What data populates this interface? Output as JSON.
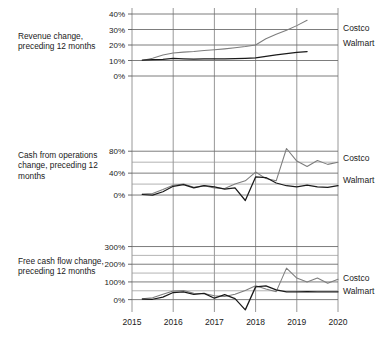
{
  "figure": {
    "width": 391,
    "height": 341,
    "background": "#ffffff",
    "line_color_costco": "#7d7d7d",
    "line_color_walmart": "#1a1a1a",
    "grid_color": "#8c8c8c"
  },
  "captions": {
    "revenue": "Revenue change, preceding 12 months",
    "cash_operations": "Cash from operations change, preceding 12 months",
    "free_cash_flow": "Free cash flow change, preceding 12 months"
  },
  "series_labels": {
    "costco": "Costco",
    "walmart": "Walmart"
  },
  "x_axis": {
    "ticks": [
      "2015",
      "2016",
      "2017",
      "2018",
      "2019",
      "2020"
    ],
    "min": 2015,
    "max": 2020
  },
  "chart_data": [
    {
      "type": "line",
      "title": "Revenue change, preceding 12 months",
      "xlabel": "",
      "ylabel": "Revenue change, preceding 12 months",
      "ylim": [
        0,
        40
      ],
      "ytick_labels": [
        "0%",
        "10%",
        "20%",
        "30%",
        "40%"
      ],
      "ytick_values": [
        0,
        10,
        20,
        30,
        40
      ],
      "yminor_values": [],
      "grid": true,
      "legend": "right-of-plot",
      "x": [
        2015.25,
        2015.5,
        2015.75,
        2016.0,
        2016.25,
        2016.5,
        2016.75,
        2017.0,
        2017.25,
        2017.5,
        2017.75,
        2018.0,
        2018.25,
        2018.5,
        2018.75,
        2019.0,
        2019.25
      ],
      "series": [
        {
          "name": "Costco",
          "values": [
            10.0,
            11.5,
            13.5,
            14.8,
            15.4,
            15.8,
            16.4,
            16.9,
            17.5,
            18.2,
            19.0,
            20.0,
            24.0,
            27.0,
            29.5,
            32.5,
            36.0
          ]
        },
        {
          "name": "Walmart",
          "values": [
            10.2,
            10.6,
            10.8,
            11.3,
            11.1,
            10.9,
            11.0,
            11.0,
            11.1,
            11.2,
            11.4,
            11.7,
            12.6,
            13.6,
            14.4,
            15.2,
            15.8
          ]
        }
      ]
    },
    {
      "type": "line",
      "title": "Cash from operations change, preceding 12 months",
      "xlabel": "",
      "ylabel": "Cash from operations change, preceding 12 months",
      "ylim": [
        -20,
        95
      ],
      "ytick_labels": [
        "0%",
        "40%",
        "80%"
      ],
      "ytick_values": [
        0,
        40,
        80
      ],
      "yminor_values": [
        20,
        60
      ],
      "grid": true,
      "legend": "right-of-plot",
      "x": [
        2015.25,
        2015.5,
        2015.75,
        2016.0,
        2016.25,
        2016.5,
        2016.75,
        2017.0,
        2017.25,
        2017.5,
        2017.75,
        2018.0,
        2018.25,
        2018.5,
        2018.75,
        2019.0,
        2019.25,
        2019.5,
        2019.75,
        2020.0
      ],
      "series": [
        {
          "name": "Costco",
          "values": [
            2.0,
            3.0,
            10.0,
            18.0,
            20.0,
            14.0,
            17.0,
            13.0,
            12.0,
            20.0,
            26.0,
            42.0,
            30.0,
            26.0,
            85.0,
            62.0,
            52.0,
            63.0,
            56.0,
            60.0
          ]
        },
        {
          "name": "Walmart",
          "values": [
            1.0,
            0.0,
            6.0,
            16.0,
            19.0,
            13.0,
            17.0,
            15.0,
            11.0,
            13.0,
            -10.0,
            33.0,
            32.0,
            22.0,
            17.0,
            15.0,
            18.0,
            15.0,
            14.0,
            17.0
          ]
        }
      ]
    },
    {
      "type": "line",
      "title": "Free cash flow change, preceding 12 months",
      "xlabel": "",
      "ylabel": "Free cash flow change, preceding 12 months",
      "ylim": [
        -70,
        320
      ],
      "ytick_labels": [
        "0%",
        "100%",
        "200%",
        "300%"
      ],
      "ytick_values": [
        0,
        100,
        200,
        300
      ],
      "yminor_values": [
        50,
        150,
        250
      ],
      "grid": true,
      "legend": "right-of-plot",
      "x": [
        2015.25,
        2015.5,
        2015.75,
        2016.0,
        2016.25,
        2016.5,
        2016.75,
        2017.0,
        2017.25,
        2017.5,
        2017.75,
        2018.0,
        2018.25,
        2018.5,
        2018.75,
        2019.0,
        2019.25,
        2019.5,
        2019.75,
        2020.0
      ],
      "series": [
        {
          "name": "Costco",
          "values": [
            5.0,
            10.0,
            30.0,
            48.0,
            52.0,
            36.0,
            34.0,
            22.0,
            18.0,
            30.0,
            52.0,
            78.0,
            60.0,
            45.0,
            178.0,
            122.0,
            100.0,
            122.0,
            92.0,
            115.0
          ]
        },
        {
          "name": "Walmart",
          "values": [
            3.0,
            2.0,
            14.0,
            40.0,
            44.0,
            30.0,
            35.0,
            8.0,
            28.0,
            6.0,
            -58.0,
            72.0,
            78.0,
            55.0,
            44.0,
            44.0,
            45.0,
            44.0,
            44.0,
            44.0
          ]
        }
      ]
    }
  ]
}
